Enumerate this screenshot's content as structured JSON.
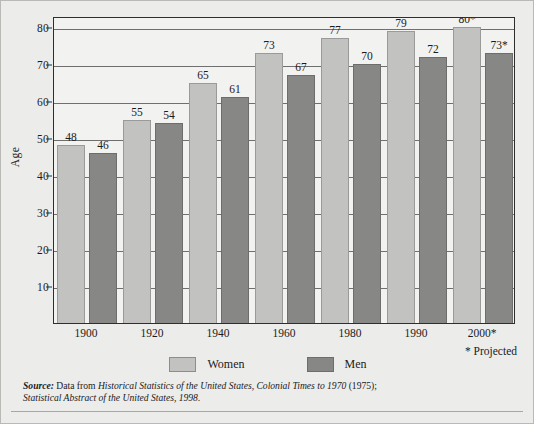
{
  "chart_data": {
    "type": "bar",
    "title": "",
    "subtitle": "",
    "xlabel": "",
    "ylabel": "Age",
    "categories": [
      "1900",
      "1920",
      "1940",
      "1960",
      "1980",
      "1990",
      "2000*"
    ],
    "series": [
      {
        "name": "Women",
        "color": "#c2c2c0",
        "values": [
          48,
          55,
          65,
          73,
          77,
          79,
          80
        ],
        "labels": [
          "48",
          "55",
          "65",
          "73",
          "77",
          "79",
          "80*"
        ]
      },
      {
        "name": "Men",
        "color": "#878785",
        "values": [
          46,
          54,
          61,
          67,
          70,
          72,
          73
        ],
        "labels": [
          "46",
          "54",
          "61",
          "67",
          "70",
          "72",
          "73*"
        ]
      }
    ],
    "ylim": [
      0,
      83
    ],
    "yticks": [
      10,
      20,
      30,
      40,
      50,
      60,
      70,
      80
    ],
    "ytick_labels": [
      "10",
      "20",
      "30",
      "40",
      "50",
      "60",
      "70",
      "80"
    ],
    "grid": true,
    "legend_position": "bottom-center",
    "annotations": [
      "* Projected"
    ]
  },
  "axis": {
    "y_title": "Age"
  },
  "legend": {
    "items": [
      {
        "label": "Women",
        "swatch": "women"
      },
      {
        "label": "Men",
        "swatch": "men"
      }
    ]
  },
  "notes": {
    "projected": "* Projected"
  },
  "source": {
    "label": "Source:",
    "line1_a": " Data from ",
    "line1_b": "Historical Statistics of the United States, Colonial Times to 1970",
    "line1_c": " (1975);",
    "line2_a": "Statistical Abstract of the United States, 1998.",
    "full_text": "Source: Data from Historical Statistics of the United States, Colonial Times to 1970 (1975); Statistical Abstract of the United States, 1998."
  },
  "colors": {
    "women_bar": "#c2c2c0",
    "men_bar": "#878785",
    "plot_background": "#f2f2f0",
    "figure_background": "#ececeb",
    "gridline": "#6f6f6f",
    "frame": "#2e2e2e",
    "text": "#1b1b1b"
  }
}
